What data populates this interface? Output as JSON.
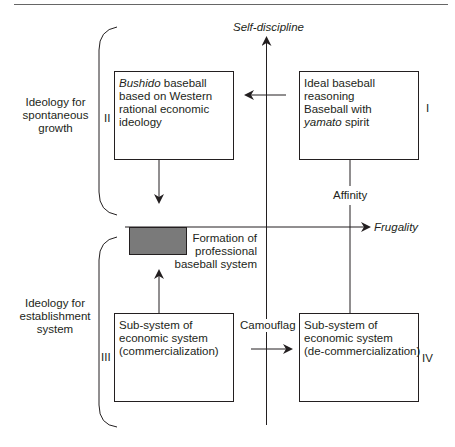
{
  "axes": {
    "vertical": {
      "label": "Self-discipline"
    },
    "horizontal": {
      "label": "Frugality"
    }
  },
  "quadrants": {
    "I": {
      "numeral": "I",
      "lines": [
        {
          "text": "Ideal baseball"
        },
        {
          "text": "reasoning"
        },
        {
          "text": "Baseball with"
        },
        {
          "italic": "yamato",
          "text": " spirit"
        }
      ]
    },
    "II": {
      "numeral": "II",
      "lines": [
        {
          "italic": "Bushido",
          "text": " baseball"
        },
        {
          "text": "based on Western"
        },
        {
          "text": "rational economic"
        },
        {
          "text": "ideology"
        }
      ]
    },
    "III": {
      "numeral": "III",
      "lines": [
        {
          "text": "Sub-system of"
        },
        {
          "text": "economic system"
        },
        {
          "text": "(commercialization)"
        }
      ]
    },
    "IV": {
      "numeral": "IV",
      "lines": [
        {
          "text": "Sub-system of"
        },
        {
          "text": "economic system"
        },
        {
          "text": "(de-commercialization)"
        }
      ]
    }
  },
  "groups": {
    "upper": {
      "lines": [
        "Ideology for",
        "spontaneous",
        "growth"
      ]
    },
    "lower": {
      "lines": [
        "Ideology for",
        "establishment",
        "system"
      ]
    }
  },
  "connectors": {
    "affinity": "Affinity",
    "camouflag": "Camouflag"
  },
  "formation": {
    "lines": [
      "Formation of",
      "professional",
      "baseball system"
    ],
    "fill_color": "#7a7a7a"
  },
  "colors": {
    "line": "#231f20",
    "rule": "#555555"
  }
}
